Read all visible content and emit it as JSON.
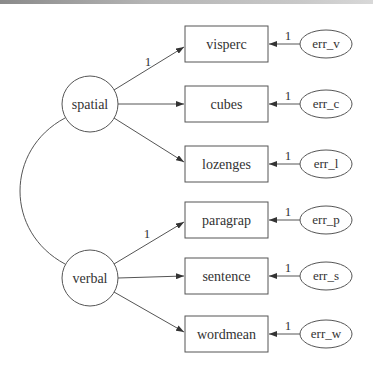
{
  "diagram": {
    "type": "structural-equation-model",
    "latent_variables": [
      {
        "id": "spatial",
        "label": "spatial",
        "cx": 90,
        "cy": 104,
        "r": 28
      },
      {
        "id": "verbal",
        "label": "verbal",
        "cx": 90,
        "cy": 278,
        "r": 28
      }
    ],
    "observed_variables": [
      {
        "id": "visperc",
        "label": "visperc",
        "y": 26,
        "factor": "spatial",
        "loading_label": "1"
      },
      {
        "id": "cubes",
        "label": "cubes",
        "y": 86,
        "factor": "spatial",
        "loading_label": ""
      },
      {
        "id": "lozenges",
        "label": "lozenges",
        "y": 146,
        "factor": "spatial",
        "loading_label": ""
      },
      {
        "id": "paragrap",
        "label": "paragrap",
        "y": 202,
        "factor": "verbal",
        "loading_label": "1"
      },
      {
        "id": "sentence",
        "label": "sentence",
        "y": 258,
        "factor": "verbal",
        "loading_label": ""
      },
      {
        "id": "wordmean",
        "label": "wordmean",
        "y": 316,
        "factor": "verbal",
        "loading_label": ""
      }
    ],
    "error_terms": [
      {
        "id": "err_v",
        "label": "err_v",
        "target": "visperc",
        "weight": "1"
      },
      {
        "id": "err_c",
        "label": "err_c",
        "target": "cubes",
        "weight": "1"
      },
      {
        "id": "err_l",
        "label": "err_l",
        "target": "lozenges",
        "weight": "1"
      },
      {
        "id": "err_p",
        "label": "err_p",
        "target": "paragrap",
        "weight": "1"
      },
      {
        "id": "err_s",
        "label": "err_s",
        "target": "sentence",
        "weight": "1"
      },
      {
        "id": "err_w",
        "label": "err_w",
        "target": "wordmean",
        "weight": "1"
      }
    ],
    "covariances": [
      {
        "from": "spatial",
        "to": "verbal"
      }
    ],
    "colors": {
      "stroke": "#555555",
      "text": "#333333",
      "background": "#ffffff"
    }
  }
}
